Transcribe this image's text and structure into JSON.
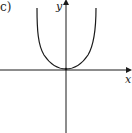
{
  "figure": {
    "panel_label": "c)",
    "x_axis_label": "x",
    "y_axis_label": "y",
    "curve_description": "U-shaped curve with minimum at origin, rising steeply on both sides"
  },
  "colors": {
    "ink": "#1a1a1a",
    "background": "#ffffff"
  }
}
